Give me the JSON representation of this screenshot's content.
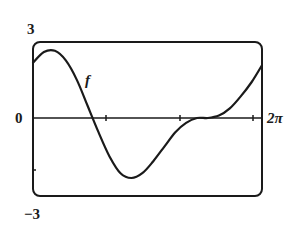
{
  "chart_data": {
    "type": "line",
    "title": "",
    "xlabel": "",
    "ylabel": "",
    "xlim": [
      0,
      6.2832
    ],
    "ylim": [
      -3,
      3
    ],
    "x_tick_labels": {
      "right": "2π"
    },
    "y_tick_labels": {
      "top": "3",
      "zero": "0",
      "bottom": "-3"
    },
    "x_ticks": [
      2.0,
      4.0,
      6.0
    ],
    "y_ticks": [
      -3,
      0,
      3
    ],
    "series": [
      {
        "name": "f",
        "x": [
          0,
          0.3,
          0.6,
          0.9,
          1.2,
          1.5,
          1.8,
          2.1,
          2.4,
          2.7,
          3.0,
          3.3,
          3.6,
          3.9,
          4.2,
          4.5,
          4.8,
          5.1,
          5.4,
          5.7,
          6.0,
          6.2832
        ],
        "values": [
          2.3,
          2.75,
          2.8,
          2.4,
          1.6,
          0.5,
          -0.6,
          -1.6,
          -2.3,
          -2.5,
          -2.3,
          -1.8,
          -1.2,
          -0.6,
          -0.2,
          0.0,
          0.0,
          0.1,
          0.4,
          0.9,
          1.5,
          2.2
        ]
      }
    ],
    "annotations": [
      {
        "text": "f",
        "x": 1.55,
        "y": 1.3
      }
    ],
    "grid": false,
    "legend": null
  },
  "labels": {
    "y_top": "3",
    "y_zero": "0",
    "y_bottom": "−3",
    "x_right": "2π",
    "curve": "f"
  }
}
